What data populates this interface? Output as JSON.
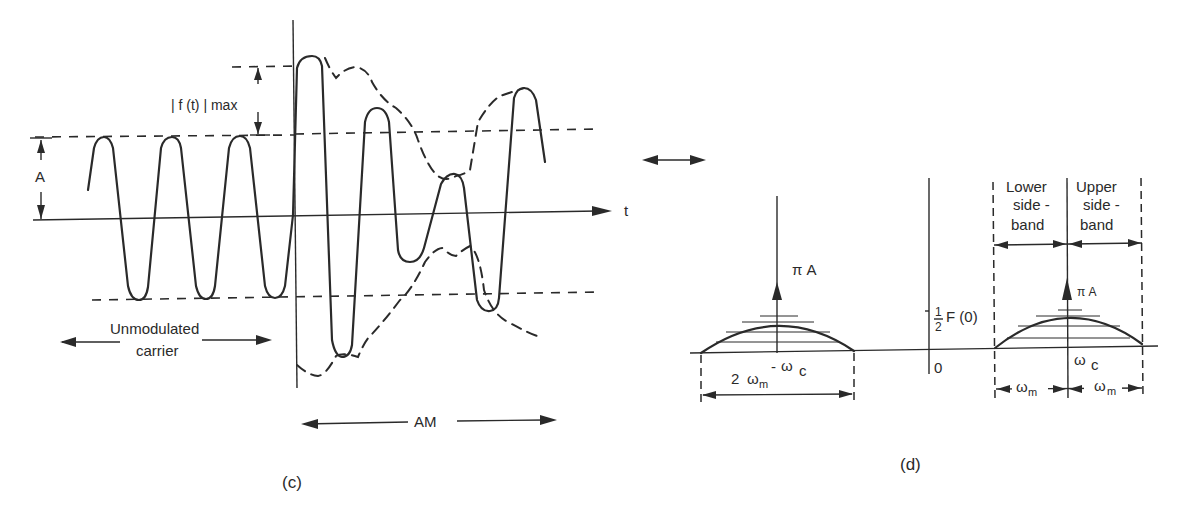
{
  "figure": {
    "panels": [
      {
        "id": "c",
        "caption": "(c)",
        "type": "time-domain AM waveform",
        "labels": {
          "amplitude": "A",
          "fmax": "| f (t) | max",
          "time_axis": "t",
          "unmodulated_line1": "Unmodulated",
          "unmodulated_line2": "carrier",
          "am": "AM"
        }
      },
      {
        "id": "d",
        "caption": "(d)",
        "type": "frequency spectrum",
        "labels": {
          "impulse_left": "π A",
          "impulse_right": "π A",
          "neg_carrier_minus": "-",
          "neg_carrier": "ω",
          "neg_carrier_sub": "c",
          "bandwidth_num": "2",
          "bandwidth_omega": "ω",
          "bandwidth_sub": "m",
          "half_num": "1",
          "half_den": "2",
          "half_F0": "F (0)",
          "origin": "0",
          "pos_carrier": "ω",
          "pos_carrier_sub": "c",
          "lower_sb_1": "Lower",
          "lower_sb_2": "side -",
          "lower_sb_3": "band",
          "upper_sb_1": "Upper",
          "upper_sb_2": "side -",
          "upper_sb_3": "band",
          "wm_left": "ω",
          "wm_left_sub": "m",
          "wm_right": "ω",
          "wm_right_sub": "m"
        }
      }
    ]
  }
}
